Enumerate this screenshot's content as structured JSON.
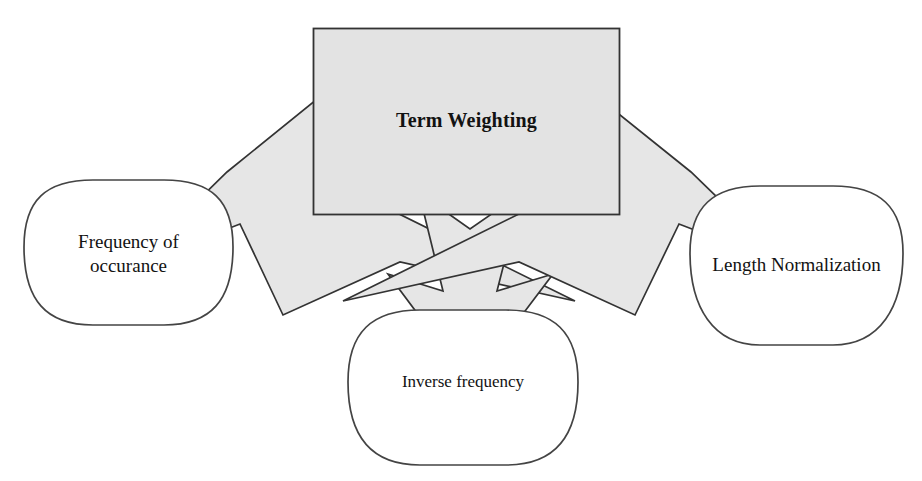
{
  "diagram": {
    "title_text": "Term Weighting",
    "type": "concept-map",
    "nodes": [
      {
        "id": "center",
        "label": "Term Weighting",
        "shape": "rectangle",
        "fill": "#e3e3e3",
        "stroke": "#333333",
        "bold": true
      },
      {
        "id": "left",
        "label": "Frequency of\noccurance",
        "shape": "rounded-rectangle",
        "fill": "#ffffff",
        "stroke": "#444444",
        "bold": false
      },
      {
        "id": "middle",
        "label": "Inverse frequency",
        "shape": "rounded-rectangle",
        "fill": "#ffffff",
        "stroke": "#444444",
        "bold": false
      },
      {
        "id": "right",
        "label": "Length Normalization",
        "shape": "rounded-rectangle",
        "fill": "#ffffff",
        "stroke": "#444444",
        "bold": false
      }
    ],
    "arrows": [
      {
        "id": "arrow-left",
        "from": "center",
        "to": "left",
        "direction": "down-left",
        "style": "block-arrow",
        "fill": "#e6e6e6",
        "stroke": "#333333"
      },
      {
        "id": "arrow-middle",
        "from": "center",
        "to": "middle",
        "direction": "down",
        "style": "block-arrow",
        "fill": "#e6e6e6",
        "stroke": "#333333"
      },
      {
        "id": "arrow-right",
        "from": "center",
        "to": "right",
        "direction": "down-right",
        "style": "block-arrow",
        "fill": "#e6e6e6",
        "stroke": "#333333"
      }
    ],
    "colors": {
      "background": "#ffffff",
      "box_fill": "#e3e3e3",
      "arrow_fill": "#e6e6e6",
      "outline": "#333333",
      "text": "#121212"
    }
  }
}
